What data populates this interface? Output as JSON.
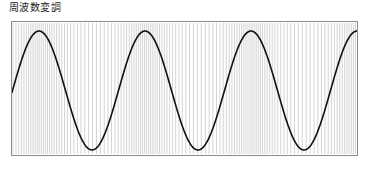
{
  "figure": {
    "caption": "周波数変調",
    "caption_romaji_meaning": "Frequency Modulation"
  },
  "frame": {
    "border_color": "#8c8c8c",
    "background_color": "#ffffff",
    "x": 11,
    "y": 21,
    "width": 347,
    "height": 135
  },
  "chart_data": {
    "type": "line",
    "title": "周波数変調",
    "xlabel": "",
    "ylabel": "",
    "grid": false,
    "legend": null,
    "xlim": [
      0,
      345
    ],
    "ylim": [
      -1,
      1
    ],
    "series": [
      {
        "name": "modulating-sine",
        "role": "modulating signal envelope",
        "color": "#111111",
        "line_width": 1.6,
        "waveform": "sine",
        "cycles": 3,
        "period_px": 106,
        "phase_offset_px": 27,
        "amplitude_norm": 0.9,
        "peak_x": [
          78,
          184,
          290
        ],
        "peak_y_px": 31,
        "trough_x": [
          25,
          131,
          237,
          343
        ],
        "trough_y_px": 150,
        "midline_y_px": 90
      },
      {
        "name": "fm-carrier",
        "role": "frequency modulated carrier",
        "color": "#c9c9c9",
        "line_width": 0.8,
        "waveform": "vertical-strokes",
        "stroke_count": 116,
        "mean_spacing_px": 3.0,
        "min_spacing_px": 2.1,
        "max_spacing_px": 4.2,
        "modulation_index": 0.32,
        "description": "dense vertical carrier lines whose spacing tightens near the sine peaks and widens near the sine troughs"
      }
    ]
  }
}
